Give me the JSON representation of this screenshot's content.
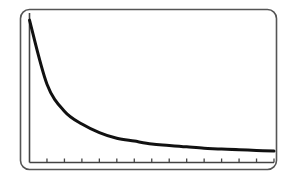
{
  "chart_data": {
    "type": "line",
    "title": "",
    "xlabel": "",
    "ylabel": "",
    "grid": false,
    "legend": null,
    "x_tick_count": 14,
    "x": [
      0,
      1,
      2,
      3,
      4,
      5,
      6,
      7,
      8,
      9,
      10,
      11,
      12,
      13,
      14
    ],
    "series": [
      {
        "name": "decay curve",
        "values": [
          1.0,
          0.55,
          0.36,
          0.27,
          0.21,
          0.17,
          0.15,
          0.13,
          0.12,
          0.11,
          0.1,
          0.095,
          0.09,
          0.085,
          0.08
        ]
      }
    ],
    "xlim": [
      0,
      14
    ],
    "ylim": [
      0,
      1.05
    ]
  },
  "colors": {
    "frame": "#555555",
    "axis": "#444444",
    "curve": "#111111",
    "background": "#ffffff"
  }
}
